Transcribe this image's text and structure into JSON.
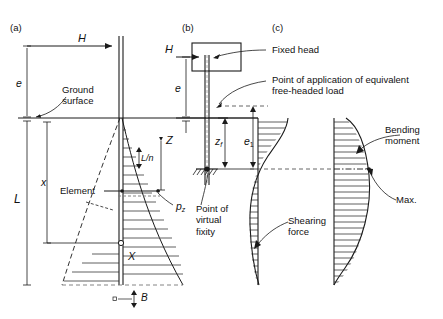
{
  "figure": {
    "panels": [
      {
        "id": "a",
        "label": "(a)",
        "caption": "Free-headed pile"
      },
      {
        "id": "b",
        "label": "(b)",
        "caption": "Fixed-head pile"
      },
      {
        "id": "c",
        "label": "(c)",
        "caption": "Shearing force and bending moment diagrams"
      }
    ],
    "annotations": {
      "ground_surface": "Ground\nsurface",
      "element": "Element",
      "fixed_head": "Fixed head",
      "point_of_application": "Point of application of equivalent\nfree-headed load",
      "point_of_virtual_fixity": "Point of\nvirtual\nfixity",
      "shearing_force": "Shearing\nforce",
      "bending_moment": "Bending\nmoment",
      "max": "Max."
    },
    "symbols": {
      "load_a": "H",
      "load_b": "H",
      "eccentricity_a": "e",
      "eccentricity_b": "e",
      "pile_length": "L",
      "depth_x": "x",
      "element_depth": "Z",
      "element_thickness": "L/n",
      "pressure": "p",
      "pressure_sub": "z",
      "section_x": "X",
      "pile_width": "B",
      "depth_to_fixity": "z",
      "depth_to_fixity_sub": "f",
      "equiv_eccentricity": "e",
      "equiv_eccentricity_sub": "1"
    },
    "colors": {
      "line": "#1a1a1a",
      "hatch": "#2b2b2b",
      "dashed": "#555555",
      "background": "#ffffff"
    }
  }
}
